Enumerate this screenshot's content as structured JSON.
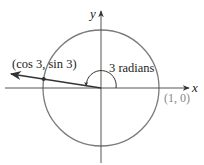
{
  "diagram": {
    "type": "unit-circle",
    "axes": {
      "x_label": "x",
      "y_label": "y"
    },
    "labels": {
      "point_on_axis": "(1, 0)",
      "point_on_circle": "(cos 3, sin 3)",
      "angle": "3 radians"
    },
    "angle_radians": 3,
    "colors": {
      "circle": "#7a7a7a",
      "axes": "#555555",
      "ray": "#333333",
      "text": "#222222",
      "muted_text": "#888888"
    }
  }
}
